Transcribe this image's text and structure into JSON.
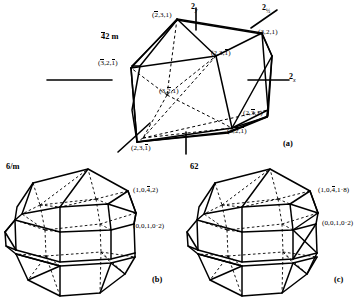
{
  "figure_a": {
    "panel_id": "(a)",
    "point_group": "42m",
    "point_group_bar_digit": "4",
    "point_group_rest": "2 m",
    "axis_labels": [
      {
        "name": "two-fold-y-axis",
        "base": "2",
        "sub": "y"
      },
      {
        "name": "two-fold-half-axis",
        "base": "2",
        "sub": "½"
      },
      {
        "name": "two-fold-x-axis",
        "base": "2",
        "sub": "x"
      }
    ],
    "face_labels": [
      {
        "name": "face-label-top",
        "parts": [
          {
            "t": "(",
            "bar": false
          },
          {
            "t": "2",
            "bar": true
          },
          {
            "t": ",3,1)",
            "bar": false
          }
        ]
      },
      {
        "name": "face-label-upper-right",
        "parts": [
          {
            "t": "(3,2,1)",
            "bar": false
          }
        ]
      },
      {
        "name": "face-label-right-upper",
        "parts": [
          {
            "t": "(2,3,",
            "bar": false
          },
          {
            "t": "1",
            "bar": true
          },
          {
            "t": ")",
            "bar": false
          }
        ]
      },
      {
        "name": "face-label-left",
        "parts": [
          {
            "t": "(",
            "bar": false
          },
          {
            "t": "3",
            "bar": true
          },
          {
            "t": ",2,",
            "bar": false
          },
          {
            "t": "1",
            "bar": true
          },
          {
            "t": ")",
            "bar": false
          }
        ]
      },
      {
        "name": "face-label-center",
        "parts": [
          {
            "t": "(3,",
            "bar": false
          },
          {
            "t": "2",
            "bar": true
          },
          {
            "t": ",1)",
            "bar": false
          }
        ]
      },
      {
        "name": "face-label-right-lower",
        "parts": [
          {
            "t": "(2,",
            "bar": false
          },
          {
            "t": "3",
            "bar": true
          },
          {
            "t": ",1)",
            "bar": false
          }
        ]
      },
      {
        "name": "face-label-bottom-right",
        "parts": [
          {
            "t": "(3,",
            "bar": false
          },
          {
            "t": "2",
            "bar": true
          },
          {
            "t": ",",
            "bar": false
          },
          {
            "t": "1",
            "bar": true
          },
          {
            "t": ")",
            "bar": false
          }
        ]
      },
      {
        "name": "face-label-bottom-left",
        "parts": [
          {
            "t": "(2,3,",
            "bar": false
          },
          {
            "t": "1",
            "bar": true
          },
          {
            "t": ")",
            "bar": false
          }
        ]
      }
    ]
  },
  "figure_b": {
    "panel_id": "(b)",
    "point_group": "6/m",
    "face_labels": [
      {
        "name": "face-label-pyramid",
        "parts": [
          {
            "t": "(1,0,",
            "bar": false
          },
          {
            "t": "4",
            "bar": true
          },
          {
            "t": ",2)",
            "bar": false
          }
        ]
      },
      {
        "name": "face-label-prism",
        "parts": [
          {
            "t": "(0,0,1,0·2)",
            "bar": false
          }
        ]
      }
    ]
  },
  "figure_c": {
    "panel_id": "(c)",
    "point_group": "62",
    "face_labels": [
      {
        "name": "face-label-pyramid",
        "parts": [
          {
            "t": "(1,0,",
            "bar": false
          },
          {
            "t": "4",
            "bar": true
          },
          {
            "t": ",1·8)",
            "bar": false
          }
        ]
      },
      {
        "name": "face-label-prism",
        "parts": [
          {
            "t": "(0,0,1,0·2)",
            "bar": false
          }
        ]
      }
    ]
  },
  "colors": {
    "ink": "#000000",
    "background": "#ffffff"
  }
}
